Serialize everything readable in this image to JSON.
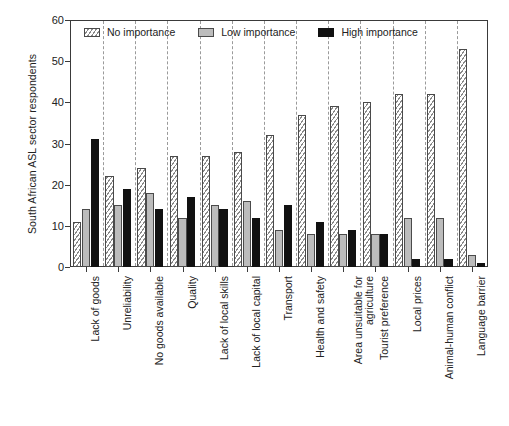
{
  "chart_data": {
    "type": "bar",
    "title": "",
    "xlabel": "",
    "ylabel": "South African ASL sector respondents",
    "ylim": [
      0,
      60
    ],
    "yticks": [
      0,
      10,
      20,
      30,
      40,
      50,
      60
    ],
    "grid": "vertical-dashed-between-groups",
    "legend_position": "top-left-inside",
    "categories": [
      "Lack of goods",
      "Unreliability",
      "No goods available",
      "Quality",
      "Lack of local skills",
      "Lack of local capital",
      "Transport",
      "Health and safety",
      "Area unsuitable for agriculture",
      "Tourist preference",
      "Local prices",
      "Animal-human conflict",
      "Language barrier"
    ],
    "series": [
      {
        "name": "No importance",
        "color": "#ffffff",
        "pattern": "diagonal-hatch",
        "values": [
          11,
          22,
          24,
          27,
          27,
          28,
          32,
          37,
          39,
          40,
          42,
          42,
          53
        ]
      },
      {
        "name": "Low importance",
        "color": "#bcbcbc",
        "pattern": "solid-gray",
        "values": [
          14,
          15,
          18,
          12,
          15,
          16,
          9,
          8,
          8,
          8,
          12,
          12,
          3
        ]
      },
      {
        "name": "High importance",
        "color": "#111111",
        "pattern": "solid-black",
        "values": [
          31,
          19,
          14,
          17,
          14,
          12,
          15,
          11,
          9,
          8,
          2,
          2,
          1
        ]
      }
    ]
  },
  "axis": {
    "y_title": "South African ASL sector respondents",
    "y_tick_labels": [
      "0",
      "10",
      "20",
      "30",
      "40",
      "50",
      "60"
    ]
  },
  "legend": {
    "items": [
      {
        "label": "No importance",
        "swatch": "hatched-swatch"
      },
      {
        "label": "Low importance",
        "swatch": "gray-swatch"
      },
      {
        "label": "High importance",
        "swatch": "black-swatch"
      }
    ]
  },
  "caption": {
    "text": ""
  }
}
